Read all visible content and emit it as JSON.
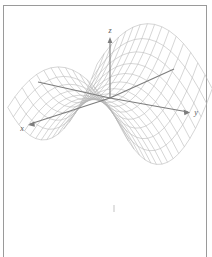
{
  "figure": {
    "kind": "3d-surface-wireframe",
    "background_color": "#ffffff",
    "frame_color": "#9a9a9a",
    "mesh_color": "#b4b4b4",
    "axis_color": "#7d7d7d",
    "label_color": "#5a5a5a"
  },
  "axes": {
    "x": {
      "label": "x",
      "label_x": 22,
      "label_y": 130
    },
    "y": {
      "label": "y",
      "label_y_x": 194,
      "label_y_y": 113
    },
    "z": {
      "label": "z",
      "label_z_x": 110,
      "label_z_y": 33
    }
  },
  "chart_data": {
    "type": "surface",
    "title": "",
    "xlabel": "x",
    "ylabel": "y",
    "zlabel": "z",
    "surface_equation": "z = x^2 - y^2",
    "u_range": [
      -1,
      1
    ],
    "v_range": [
      -1,
      1
    ],
    "u_steps": 16,
    "v_steps": 16,
    "grid": true,
    "legend": false,
    "axis_arrows": true,
    "projection": {
      "origin_x": 110,
      "origin_y": 98,
      "x_axis_vector": [
        -0.62,
        0.3
      ],
      "y_axis_vector": [
        0.8,
        0.17
      ],
      "z_axis_vector": [
        0,
        -1
      ],
      "x_scale": 72,
      "y_scale": 72,
      "z_scale": 52
    },
    "axis_endpoints": {
      "x_positive": [
        172,
        70
      ],
      "x_negative": [
        30,
        124
      ],
      "y_positive": [
        188,
        112
      ],
      "y_negative": [
        38,
        82
      ],
      "z_positive": [
        110,
        38
      ],
      "origin": [
        110,
        98
      ]
    }
  }
}
